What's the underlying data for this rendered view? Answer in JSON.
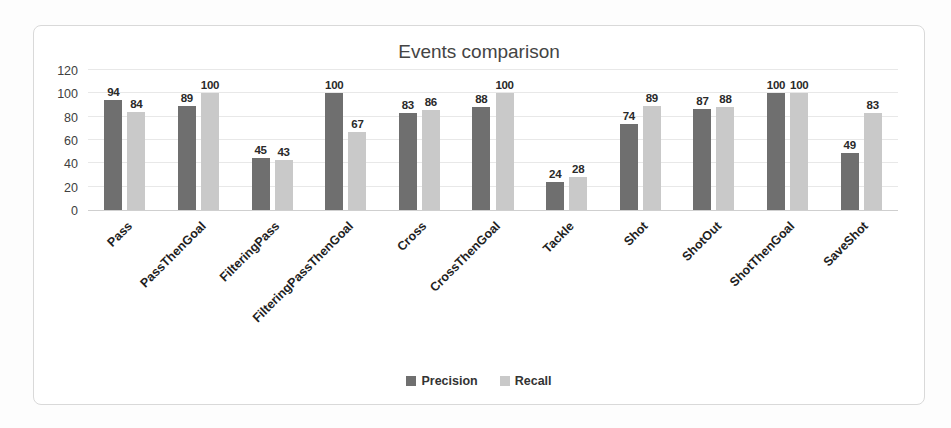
{
  "chart_data": {
    "type": "bar",
    "title": "Events comparison",
    "categories": [
      "Pass",
      "PassThenGoal",
      "FilteringPass",
      "FilteringPassThenGoal",
      "Cross",
      "CrossThenGoal",
      "Tackle",
      "Shot",
      "ShotOut",
      "ShotThenGoal",
      "SaveShot"
    ],
    "series": [
      {
        "name": "Precision",
        "color": "#6f6f6f",
        "values": [
          94,
          89,
          45,
          100,
          83,
          88,
          24,
          74,
          87,
          100,
          49
        ]
      },
      {
        "name": "Recall",
        "color": "#c9c9c9",
        "values": [
          84,
          100,
          43,
          67,
          86,
          100,
          28,
          89,
          88,
          100,
          83
        ]
      }
    ],
    "xlabel": "",
    "ylabel": "",
    "ylim": [
      0,
      120
    ],
    "yticks": [
      0,
      20,
      40,
      60,
      80,
      100,
      120
    ],
    "grid": true,
    "legend_position": "bottom",
    "bar_value_labels": true
  }
}
